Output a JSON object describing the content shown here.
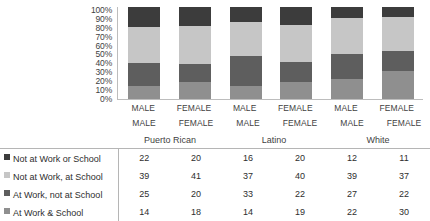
{
  "chart_data": {
    "type": "bar",
    "subtype": "stacked-percent",
    "title": "",
    "xlabel": "",
    "ylabel": "",
    "ylim": [
      0,
      100
    ],
    "grid": false,
    "legend_position": "bottom-left",
    "y_ticks": [
      "100%",
      "90%",
      "80%",
      "70%",
      "60%",
      "50%",
      "40%",
      "30%",
      "20%",
      "10%",
      "0%"
    ],
    "categories": [
      "MALE",
      "FEMALE",
      "MALE",
      "FEMALE",
      "MALE",
      "FEMALE"
    ],
    "groups": [
      {
        "label": "Puerto Rican",
        "span": 2
      },
      {
        "label": "Latino",
        "span": 2
      },
      {
        "label": "White",
        "span": 2
      }
    ],
    "series": [
      {
        "name": "Not at Work or School",
        "color": "#3c3c3c",
        "values": [
          22,
          20,
          16,
          20,
          12,
          11
        ]
      },
      {
        "name": "Not at Work, at School",
        "color": "#c6c6c6",
        "values": [
          39,
          41,
          37,
          40,
          39,
          37
        ]
      },
      {
        "name": "At Work, not at School",
        "color": "#5e5e5e",
        "values": [
          25,
          20,
          33,
          22,
          27,
          22
        ]
      },
      {
        "name": "At Work & School",
        "color": "#8f8f8f",
        "values": [
          14,
          18,
          14,
          19,
          22,
          30
        ]
      }
    ]
  },
  "table": {
    "row_header_labels": [
      "Not at Work or School",
      "Not at Work, at School",
      "At Work, not at School",
      "At Work & School"
    ],
    "column_headers": [
      "MALE",
      "FEMALE",
      "MALE",
      "FEMALE",
      "MALE",
      "FEMALE"
    ],
    "group_headers": [
      "Puerto Rican",
      "Latino",
      "White"
    ],
    "rows": [
      {
        "label": "Not at Work or School",
        "values": [
          22,
          20,
          16,
          20,
          12,
          11
        ]
      },
      {
        "label": "Not at Work, at School",
        "values": [
          39,
          41,
          37,
          40,
          39,
          37
        ]
      },
      {
        "label": "At Work, not at School",
        "values": [
          25,
          20,
          33,
          22,
          27,
          22
        ]
      },
      {
        "label": "At Work & School",
        "values": [
          14,
          18,
          14,
          19,
          22,
          30
        ]
      }
    ]
  },
  "colors": {
    "series_1": "#3c3c3c",
    "series_2": "#c6c6c6",
    "series_3": "#5e5e5e",
    "series_4": "#8f8f8f",
    "axis": "#bdbdbd",
    "rule": "#b5b5b5",
    "text": "#2e2e2e"
  }
}
